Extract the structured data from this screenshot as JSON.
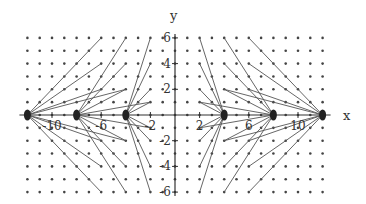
{
  "chart_data": {
    "type": "diagram",
    "title": "",
    "xlabel": "x",
    "ylabel": "y",
    "xlim": [
      -12,
      12
    ],
    "ylim": [
      -6,
      6
    ],
    "x_ticks": [
      -10,
      -6,
      -2,
      2,
      6,
      10
    ],
    "y_ticks": [
      -6,
      -4,
      -2,
      2,
      4,
      6
    ],
    "grid_dots": {
      "x_range": [
        -12,
        12
      ],
      "y_range": [
        -6,
        6
      ],
      "step": 1
    },
    "source_points": [
      -12,
      -8,
      -4,
      4,
      8,
      12
    ],
    "segments": [
      {
        "from": [
          -12,
          0
        ],
        "to": [
          -6,
          6
        ]
      },
      {
        "from": [
          -12,
          0
        ],
        "to": [
          -6,
          4
        ]
      },
      {
        "from": [
          -12,
          0
        ],
        "to": [
          -6,
          2
        ]
      },
      {
        "from": [
          -12,
          0
        ],
        "to": [
          -4,
          2
        ]
      },
      {
        "from": [
          -12,
          0
        ],
        "to": [
          -6,
          -2
        ]
      },
      {
        "from": [
          -12,
          0
        ],
        "to": [
          -6,
          -4
        ]
      },
      {
        "from": [
          -12,
          0
        ],
        "to": [
          -6,
          -6
        ]
      },
      {
        "from": [
          -12,
          0
        ],
        "to": [
          -4,
          -2
        ]
      },
      {
        "from": [
          -8,
          0
        ],
        "to": [
          -4,
          6
        ]
      },
      {
        "from": [
          -8,
          0
        ],
        "to": [
          -4,
          4
        ]
      },
      {
        "from": [
          -8,
          0
        ],
        "to": [
          -4,
          2
        ]
      },
      {
        "from": [
          -8,
          0
        ],
        "to": [
          -2,
          1
        ]
      },
      {
        "from": [
          -8,
          0
        ],
        "to": [
          -4,
          -2
        ]
      },
      {
        "from": [
          -8,
          0
        ],
        "to": [
          -4,
          -4
        ]
      },
      {
        "from": [
          -8,
          0
        ],
        "to": [
          -4,
          -6
        ]
      },
      {
        "from": [
          -8,
          0
        ],
        "to": [
          -2,
          -1
        ]
      },
      {
        "from": [
          -4,
          0
        ],
        "to": [
          -2,
          6
        ]
      },
      {
        "from": [
          -4,
          0
        ],
        "to": [
          -2,
          4
        ]
      },
      {
        "from": [
          -4,
          0
        ],
        "to": [
          -2,
          2
        ]
      },
      {
        "from": [
          -4,
          0
        ],
        "to": [
          -2,
          1
        ]
      },
      {
        "from": [
          -4,
          0
        ],
        "to": [
          -2,
          -2
        ]
      },
      {
        "from": [
          -4,
          0
        ],
        "to": [
          -2,
          -4
        ]
      },
      {
        "from": [
          -4,
          0
        ],
        "to": [
          -2,
          -6
        ]
      },
      {
        "from": [
          -4,
          0
        ],
        "to": [
          -2,
          -1
        ]
      },
      {
        "from": [
          4,
          0
        ],
        "to": [
          2,
          6
        ]
      },
      {
        "from": [
          4,
          0
        ],
        "to": [
          2,
          4
        ]
      },
      {
        "from": [
          4,
          0
        ],
        "to": [
          2,
          2
        ]
      },
      {
        "from": [
          4,
          0
        ],
        "to": [
          2,
          1
        ]
      },
      {
        "from": [
          4,
          0
        ],
        "to": [
          2,
          -2
        ]
      },
      {
        "from": [
          4,
          0
        ],
        "to": [
          2,
          -4
        ]
      },
      {
        "from": [
          4,
          0
        ],
        "to": [
          2,
          -6
        ]
      },
      {
        "from": [
          4,
          0
        ],
        "to": [
          2,
          -1
        ]
      },
      {
        "from": [
          8,
          0
        ],
        "to": [
          4,
          6
        ]
      },
      {
        "from": [
          8,
          0
        ],
        "to": [
          4,
          4
        ]
      },
      {
        "from": [
          8,
          0
        ],
        "to": [
          4,
          2
        ]
      },
      {
        "from": [
          8,
          0
        ],
        "to": [
          2,
          1
        ]
      },
      {
        "from": [
          8,
          0
        ],
        "to": [
          4,
          -2
        ]
      },
      {
        "from": [
          8,
          0
        ],
        "to": [
          4,
          -4
        ]
      },
      {
        "from": [
          8,
          0
        ],
        "to": [
          4,
          -6
        ]
      },
      {
        "from": [
          8,
          0
        ],
        "to": [
          2,
          -1
        ]
      },
      {
        "from": [
          12,
          0
        ],
        "to": [
          6,
          6
        ]
      },
      {
        "from": [
          12,
          0
        ],
        "to": [
          6,
          4
        ]
      },
      {
        "from": [
          12,
          0
        ],
        "to": [
          6,
          2
        ]
      },
      {
        "from": [
          12,
          0
        ],
        "to": [
          4,
          2
        ]
      },
      {
        "from": [
          12,
          0
        ],
        "to": [
          6,
          -2
        ]
      },
      {
        "from": [
          12,
          0
        ],
        "to": [
          6,
          -4
        ]
      },
      {
        "from": [
          12,
          0
        ],
        "to": [
          6,
          -6
        ]
      },
      {
        "from": [
          12,
          0
        ],
        "to": [
          4,
          -2
        ]
      }
    ],
    "colors": {
      "line": "#555555",
      "dot": "#444444",
      "axis": "#333333",
      "source": "#222222"
    }
  },
  "axes": {
    "x_label": "x",
    "y_label": "y"
  }
}
